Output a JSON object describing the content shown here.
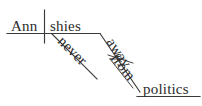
{
  "diagram": {
    "type": "reed-kellogg-sentence-diagram",
    "sentence": "Ann never shies away from politics",
    "ink_color": "#2b2b2b",
    "line_color": "#3a3a3a",
    "background_color": "#ffffff",
    "nodes": {
      "subject": {
        "label": "Ann",
        "role": "subject",
        "orientation": "horizontal"
      },
      "verb": {
        "label": "shies",
        "role": "verb",
        "orientation": "horizontal"
      },
      "adverb": {
        "label": "never",
        "role": "adverb-modifying-verb",
        "orientation": "diagonal"
      },
      "adverb_particle": {
        "label": "away",
        "role": "adverb-modifying-verb",
        "orientation": "diagonal"
      },
      "preposition": {
        "label": "from",
        "role": "preposition",
        "orientation": "diagonal"
      },
      "object_of_preposition": {
        "label": "politics",
        "role": "object-of-preposition",
        "orientation": "horizontal"
      }
    }
  }
}
